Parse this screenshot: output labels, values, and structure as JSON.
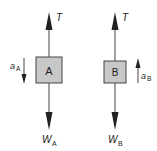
{
  "diagram": {
    "colors": {
      "line": "#333333",
      "box_fill": "#c8c8c8",
      "box_stroke": "#444444",
      "text": "#222222"
    },
    "blocks": [
      {
        "label": "A",
        "tension": "T",
        "weight": "W",
        "weight_sub": "A",
        "accel": "a",
        "accel_sub": "A",
        "accel_direction": "down",
        "accel_side": "left"
      },
      {
        "label": "B",
        "tension": "T",
        "weight": "W",
        "weight_sub": "B",
        "accel": "a",
        "accel_sub": "B",
        "accel_direction": "up",
        "accel_side": "right"
      }
    ]
  }
}
